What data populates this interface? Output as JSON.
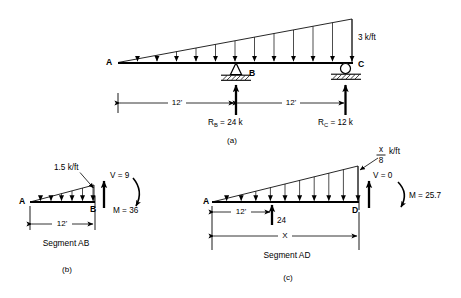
{
  "figure": {
    "panels": [
      {
        "id": "a",
        "caption": "(a)",
        "nodes": [
          {
            "name": "A",
            "label": "A"
          },
          {
            "name": "B",
            "label": "B"
          },
          {
            "name": "C",
            "label": "C"
          }
        ],
        "load_label": "3 k/ft",
        "load_type": "triangular-distributed",
        "load_arrows": 12,
        "dimensions": [
          {
            "label": "12'",
            "span": "A-B"
          },
          {
            "label": "12'",
            "span": "B-C"
          }
        ],
        "reactions": [
          {
            "name": "R_B",
            "symbol": "R",
            "subscript": "B",
            "text": "R",
            "value": "= 24 k",
            "full": "R_B = 24 k"
          },
          {
            "name": "R_C",
            "symbol": "R",
            "subscript": "C",
            "text": "R",
            "value": "= 12 k",
            "full": "R_C = 12 k"
          }
        ],
        "supports": [
          {
            "at": "B",
            "type": "pin"
          },
          {
            "at": "C",
            "type": "roller"
          }
        ]
      },
      {
        "id": "b",
        "caption": "(b)",
        "segment_label": "Segment  AB",
        "nodes": [
          {
            "name": "A",
            "label": "A"
          },
          {
            "name": "B",
            "label": "B"
          }
        ],
        "load_label": "1.5 k/ft",
        "load_arrows": 6,
        "shear_label": "V = 9",
        "moment_label": "M = 36",
        "dimensions": [
          {
            "label": "12'",
            "span": "A-B"
          }
        ]
      },
      {
        "id": "c",
        "caption": "(c)",
        "segment_label": "Segment AD",
        "nodes": [
          {
            "name": "A",
            "label": "A"
          },
          {
            "name": "D",
            "label": "D"
          }
        ],
        "load_numerator": "x",
        "load_denominator": "8",
        "load_units": "k/ft",
        "load_arrows": 10,
        "shear_label": "V = 0",
        "moment_label": "M = 25.7",
        "interior_force_label": "24",
        "dimensions": [
          {
            "label": "12'",
            "span": "A-to-B-point"
          },
          {
            "label": "X",
            "span": "A-D"
          }
        ]
      }
    ]
  },
  "colors": {
    "ink": "#000000",
    "paper": "#ffffff"
  }
}
